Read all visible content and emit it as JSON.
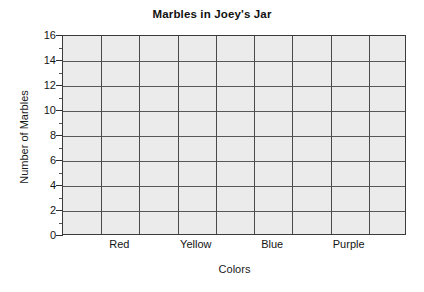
{
  "chart_data": {
    "type": "bar",
    "title": "Marbles in Joey's Jar",
    "xlabel": "Colors",
    "ylabel": "Number of Marbles",
    "categories": [
      "Red",
      "Yellow",
      "Blue",
      "Purple"
    ],
    "values": [
      null,
      null,
      null,
      null
    ],
    "series": [
      {
        "name": "Number of Marbles",
        "values": [
          null,
          null,
          null,
          null
        ]
      }
    ],
    "ylim": [
      0,
      16
    ],
    "ytick_step": 2,
    "ytick_labels": [
      "0",
      "2",
      "4",
      "6",
      "8",
      "10",
      "12",
      "14",
      "16"
    ],
    "yminor_ticks": [
      1,
      3,
      5,
      7,
      9,
      11,
      13,
      15
    ],
    "grid": {
      "horizontal": true,
      "vertical": true,
      "vertical_columns": 9
    },
    "legend": null,
    "annotations": [],
    "note": "Blank grid template - no bars plotted",
    "colors": {
      "plot_background": "#ebebeb",
      "grid_line": "#585858",
      "axis_line": "#3b3b3b",
      "text": "#141414",
      "page_background": "#ffffff"
    }
  }
}
